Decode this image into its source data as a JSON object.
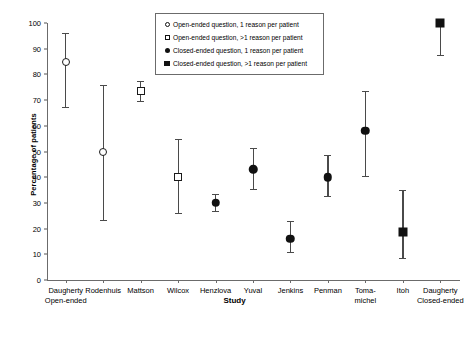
{
  "chart_data": {
    "type": "scatter",
    "title": "",
    "xlabel": "Study",
    "ylabel": "Percentage of patients",
    "ylim": [
      0,
      100
    ],
    "yticks": [
      0,
      10,
      20,
      30,
      40,
      50,
      60,
      70,
      80,
      90,
      100
    ],
    "grid": false,
    "legend_position": "top-center",
    "categories": [
      "Daugherty Open-ended",
      "Rodenhuis",
      "Mattson",
      "Wilcox",
      "Henzlova",
      "Yuval",
      "Jenkins",
      "Penman",
      "Toma-michel",
      "Itoh",
      "Daugherty Closed-ended"
    ],
    "series": [
      {
        "name": "Open-ended question, 1 reason per patient",
        "marker": "circle-open",
        "points": [
          {
            "category": "Daugherty Open-ended",
            "value": 85,
            "ci_low": 67.5,
            "ci_high": 96.0
          },
          {
            "category": "Rodenhuis",
            "value": 50,
            "ci_low": 23.5,
            "ci_high": 76.0
          }
        ]
      },
      {
        "name": "Open-ended question, >1 reason per patient",
        "marker": "square-open",
        "points": [
          {
            "category": "Mattson",
            "value": 73.5,
            "ci_low": 69.5,
            "ci_high": 77.5
          },
          {
            "category": "Wilcox",
            "value": 40,
            "ci_low": 26.0,
            "ci_high": 55.0
          }
        ]
      },
      {
        "name": "Closed-ended question, 1 reason per patient",
        "marker": "circle-filled",
        "points": [
          {
            "category": "Henzlova",
            "value": 30,
            "ci_low": 27.0,
            "ci_high": 33.5
          },
          {
            "category": "Yuval",
            "value": 43,
            "ci_low": 35.5,
            "ci_high": 51.5
          },
          {
            "category": "Jenkins",
            "value": 16,
            "ci_low": 11.0,
            "ci_high": 23.0
          },
          {
            "category": "Penman",
            "value": 40,
            "ci_low": 32.5,
            "ci_high": 48.5
          },
          {
            "category": "Toma-michel",
            "value": 58,
            "ci_low": 40.5,
            "ci_high": 73.5
          }
        ]
      },
      {
        "name": "Closed-ended question, >1 reason per patient",
        "marker": "square-filled",
        "points": [
          {
            "category": "Itoh",
            "value": 18.5,
            "ci_low": 8.5,
            "ci_high": 35.0
          },
          {
            "category": "Daugherty Closed-ended",
            "value": 100,
            "ci_low": 87.5,
            "ci_high": 100
          }
        ]
      }
    ]
  },
  "axes": {
    "y_title": "Percentage of patients",
    "x_title": "Study",
    "y_tick_labels": [
      "0",
      "10",
      "20",
      "30",
      "40",
      "50",
      "60",
      "70",
      "80",
      "90",
      "100"
    ],
    "x_tick_labels": [
      {
        "line1": "Daugherty",
        "line2": "Open-ended"
      },
      {
        "line1": "Rodenhuis",
        "line2": ""
      },
      {
        "line1": "Mattson",
        "line2": ""
      },
      {
        "line1": "Wilcox",
        "line2": ""
      },
      {
        "line1": "Henzlova",
        "line2": ""
      },
      {
        "line1": "Yuval",
        "line2": ""
      },
      {
        "line1": "Jenkins",
        "line2": ""
      },
      {
        "line1": "Penman",
        "line2": ""
      },
      {
        "line1": "Toma-",
        "line2": "michel"
      },
      {
        "line1": "Itoh",
        "line2": ""
      },
      {
        "line1": "Daugherty",
        "line2": "Closed-ended"
      }
    ]
  },
  "legend": {
    "entries": [
      {
        "marker": "circle-open",
        "label": "Open-ended question, 1 reason per patient"
      },
      {
        "marker": "square-open",
        "label": "Open-ended question, >1 reason per patient"
      },
      {
        "marker": "circle-filled",
        "label": "Closed-ended question, 1 reason per patient"
      },
      {
        "marker": "square-filled",
        "label": "Closed-ended question, >1 reason per patient"
      }
    ]
  },
  "colors": {
    "marker": "#111111",
    "axis": "#6b6b6b",
    "error_bar": "#4a4a4a",
    "background": "#ffffff"
  }
}
